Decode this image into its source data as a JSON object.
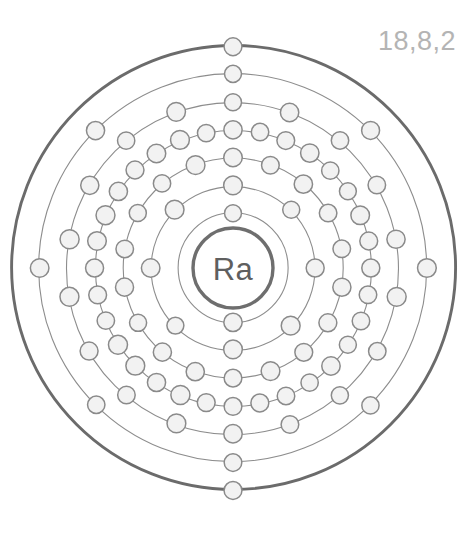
{
  "diagram": {
    "type": "bohr-atomic-model",
    "element_symbol": "Ra",
    "element_name": "Radium",
    "atomic_number": 88,
    "total_electrons": 88,
    "valence_label": "18,8,2",
    "canvas": {
      "width": 465,
      "height": 537
    },
    "center": {
      "x": 233,
      "y": 268
    },
    "nucleus": {
      "radius": 40,
      "stroke": "#6e6e6e"
    },
    "colors": {
      "background": "#ffffff",
      "shell_line": "#8d8d8d",
      "outer_shell_line": "#6b6b6b",
      "electron_fill": "#f2f2f2",
      "electron_stroke": "#8a8a8a",
      "nucleus_text": "#5f5f5f",
      "config_label": "#b4b4b4"
    },
    "electron_radius": 9,
    "shells": [
      {
        "name": "K",
        "index": 1,
        "electrons": 2,
        "radius": 55,
        "outer": false
      },
      {
        "name": "L",
        "index": 2,
        "electrons": 8,
        "radius": 82,
        "outer": false
      },
      {
        "name": "M",
        "index": 3,
        "electrons": 18,
        "radius": 110,
        "outer": false
      },
      {
        "name": "N",
        "index": 4,
        "electrons": 32,
        "radius": 138,
        "outer": false
      },
      {
        "name": "O",
        "index": 5,
        "electrons": 18,
        "radius": 166,
        "outer": false
      },
      {
        "name": "P",
        "index": 6,
        "electrons": 8,
        "radius": 194,
        "outer": false
      },
      {
        "name": "Q",
        "index": 7,
        "electrons": 2,
        "radius": 222,
        "outer": true
      }
    ],
    "shell_electron_counts": [
      2,
      8,
      18,
      32,
      18,
      8,
      2
    ]
  }
}
